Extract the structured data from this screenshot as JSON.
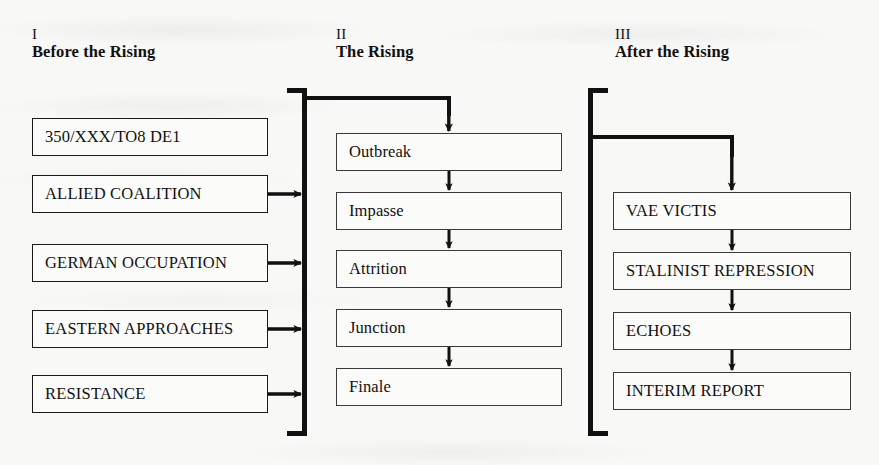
{
  "page": {
    "background_color": "#f8f8f6",
    "ink_color": "#111111"
  },
  "columns": [
    {
      "numeral": "I",
      "title": "Before the Rising",
      "nodes": [
        {
          "label": "350/XXX/TO8 DE1",
          "style": "mixed"
        },
        {
          "label": "ALLIED COALITION",
          "style": "caps"
        },
        {
          "label": "GERMAN OCCUPATION",
          "style": "caps"
        },
        {
          "label": "EASTERN APPROACHES",
          "style": "caps"
        },
        {
          "label": "RESISTANCE",
          "style": "caps"
        }
      ]
    },
    {
      "numeral": "II",
      "title": "The Rising",
      "nodes": [
        {
          "label": "Outbreak",
          "style": "mixed"
        },
        {
          "label": "Impasse",
          "style": "mixed"
        },
        {
          "label": "Attrition",
          "style": "mixed"
        },
        {
          "label": "Junction",
          "style": "mixed"
        },
        {
          "label": "Finale",
          "style": "mixed"
        }
      ]
    },
    {
      "numeral": "III",
      "title": "After the Rising",
      "nodes": [
        {
          "label": "VAE VICTIS",
          "style": "caps"
        },
        {
          "label": "STALINIST REPRESSION",
          "style": "caps"
        },
        {
          "label": "ECHOES",
          "style": "caps"
        },
        {
          "label": "INTERIM REPORT",
          "style": "caps"
        }
      ]
    }
  ],
  "connectors": {
    "column_one_to_bracket": [
      "ALLIED COALITION to Rising bracket",
      "GERMAN OCCUPATION to Rising bracket",
      "EASTERN APPROACHES to Rising bracket",
      "RESISTANCE to Rising bracket"
    ],
    "bracket_left_label": "Rising input bracket",
    "bracket_right_label": "Rising output bracket",
    "bracket_to_outbreak": "left bracket to Outbreak",
    "bracket_to_vae_victis": "right bracket to VAE VICTIS",
    "column_two_chain": [
      "Outbreak to Impasse",
      "Impasse to Attrition",
      "Attrition to Junction",
      "Junction to Finale"
    ],
    "column_three_chain": [
      "VAE VICTIS to STALINIST REPRESSION",
      "STALINIST REPRESSION to ECHOES",
      "ECHOES to INTERIM REPORT"
    ]
  }
}
